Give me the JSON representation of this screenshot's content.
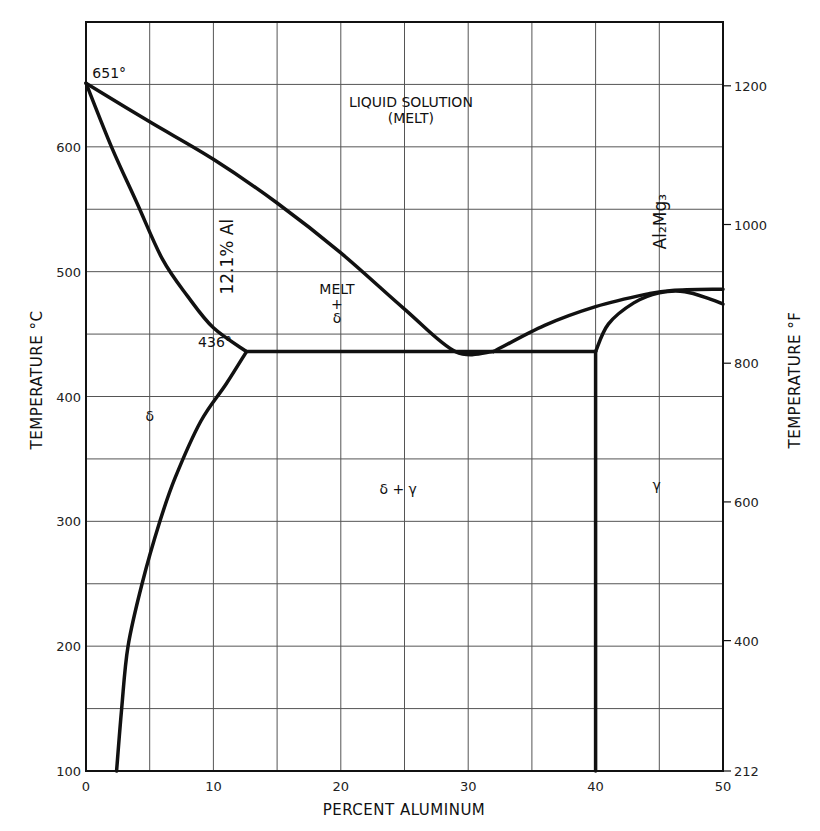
{
  "chart_data": {
    "type": "line",
    "title": "",
    "xlabel": "PERCENT ALUMINUM",
    "ylabel": "TEMPERATURE °C",
    "ylabel_right": "TEMPERATURE °F",
    "xlim": [
      0,
      50
    ],
    "ylim": [
      100,
      700
    ],
    "grid": true,
    "x_ticks": [
      0,
      10,
      20,
      30,
      40,
      50
    ],
    "x_tick_labels": [
      "0",
      "10",
      "20",
      "30",
      "40",
      "50"
    ],
    "x_grid_step": 5,
    "y_ticks": [
      100,
      200,
      300,
      400,
      500,
      600
    ],
    "y_tick_labels": [
      "100",
      "200",
      "300",
      "400",
      "500",
      "600"
    ],
    "y_grid_step": 50,
    "y_right_ticks_F": [
      212,
      400,
      600,
      800,
      1000,
      1200
    ],
    "y_right_tick_labels": [
      "212",
      "400",
      "600",
      "800",
      "1000",
      "1200"
    ],
    "series": [
      {
        "name": "liquidus-mg-side",
        "points": [
          [
            0,
            651
          ],
          [
            5,
            620
          ],
          [
            10,
            590
          ],
          [
            15,
            555
          ],
          [
            20,
            515
          ],
          [
            25,
            470
          ],
          [
            29,
            436
          ],
          [
            32,
            436
          ]
        ]
      },
      {
        "name": "solidus-delta",
        "points": [
          [
            0,
            651
          ],
          [
            2,
            600
          ],
          [
            4,
            555
          ],
          [
            6,
            510
          ],
          [
            8,
            480
          ],
          [
            10,
            455
          ],
          [
            12.6,
            436
          ]
        ]
      },
      {
        "name": "solvus-delta",
        "points": [
          [
            12.6,
            436
          ],
          [
            11,
            410
          ],
          [
            9,
            380
          ],
          [
            7,
            335
          ],
          [
            5.8,
            300
          ],
          [
            4.4,
            250
          ],
          [
            3.3,
            200
          ],
          [
            2.8,
            150
          ],
          [
            2.4,
            100
          ]
        ]
      },
      {
        "name": "eutectic-isotherm",
        "points": [
          [
            12.6,
            436
          ],
          [
            40,
            436
          ]
        ]
      },
      {
        "name": "compound-boundary",
        "points": [
          [
            40,
            100
          ],
          [
            40,
            436
          ]
        ]
      },
      {
        "name": "liquidus-al-side",
        "points": [
          [
            32,
            436
          ],
          [
            36,
            457
          ],
          [
            40,
            472
          ],
          [
            44,
            482
          ],
          [
            46,
            485
          ],
          [
            50,
            486
          ]
        ]
      },
      {
        "name": "gamma-boundary",
        "points": [
          [
            40,
            436
          ],
          [
            41,
            458
          ],
          [
            43,
            475
          ],
          [
            45,
            483
          ],
          [
            47,
            484
          ],
          [
            49,
            478
          ],
          [
            50,
            474
          ]
        ]
      }
    ],
    "annotations": [
      {
        "text": "651°",
        "x": 0.5,
        "y": 655
      },
      {
        "text": "436°",
        "x": 8.8,
        "y": 440
      },
      {
        "text": "LIQUID SOLUTION",
        "x": 25.5,
        "y": 632
      },
      {
        "text": "(MELT)",
        "x": 25.5,
        "y": 619
      },
      {
        "text": "12.1% Al",
        "x": 11.5,
        "y": 512,
        "rotation": -90
      },
      {
        "text": "MELT",
        "x": 19.7,
        "y": 482
      },
      {
        "text": "+",
        "x": 19.7,
        "y": 470
      },
      {
        "text": "δ",
        "x": 19.7,
        "y": 459
      },
      {
        "text": "δ",
        "x": 5,
        "y": 380
      },
      {
        "text": "δ + γ",
        "x": 24.5,
        "y": 322
      },
      {
        "text": "γ",
        "x": 44.8,
        "y": 325
      },
      {
        "text": "Al₂Mg₃",
        "x": 45.5,
        "y": 540,
        "rotation": -90
      }
    ]
  }
}
